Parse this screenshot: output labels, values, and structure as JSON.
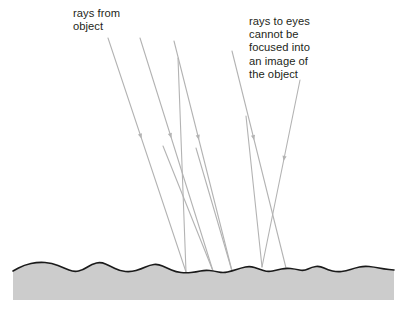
{
  "figure": {
    "type": "optics-diagram",
    "width": 406,
    "height": 313,
    "background_color": "#ffffff"
  },
  "annotations": [
    {
      "id": "rays-from-object",
      "text": "rays from\nobject",
      "lines": [
        "rays from",
        "object"
      ],
      "x": 73,
      "y": 7,
      "color": "#231f20"
    },
    {
      "id": "rays-to-eyes",
      "text": "rays to eyes\ncannot be\nfocused into\nan image of\nthe object",
      "lines": [
        "rays to eyes",
        "cannot be",
        "focused into",
        "an image of",
        "the object"
      ],
      "x": 249,
      "y": 15,
      "color": "#231f20"
    }
  ],
  "surface": {
    "name": "rough-surface",
    "fill_color": "#cccccc",
    "stroke_color": "#1a1a1a",
    "stroke_width": 1.6,
    "left_x": 13,
    "right_x": 394,
    "bottom_y": 300,
    "profile_points": [
      [
        13,
        271
      ],
      [
        24,
        265
      ],
      [
        38,
        262
      ],
      [
        52,
        263
      ],
      [
        64,
        268
      ],
      [
        74,
        272
      ],
      [
        83,
        270
      ],
      [
        92,
        264
      ],
      [
        101,
        262
      ],
      [
        110,
        266
      ],
      [
        120,
        271
      ],
      [
        131,
        272
      ],
      [
        141,
        269
      ],
      [
        150,
        265
      ],
      [
        158,
        264
      ],
      [
        167,
        268
      ],
      [
        176,
        272
      ],
      [
        186,
        273
      ],
      [
        196,
        272
      ],
      [
        205,
        270
      ],
      [
        214,
        271
      ],
      [
        223,
        273
      ],
      [
        232,
        271
      ],
      [
        241,
        268
      ],
      [
        250,
        266
      ],
      [
        259,
        269
      ],
      [
        268,
        272
      ],
      [
        277,
        270
      ],
      [
        286,
        268
      ],
      [
        295,
        269
      ],
      [
        304,
        271
      ],
      [
        312,
        267
      ],
      [
        320,
        266
      ],
      [
        328,
        270
      ],
      [
        337,
        272
      ],
      [
        346,
        271
      ],
      [
        355,
        268
      ],
      [
        364,
        266
      ],
      [
        374,
        267
      ],
      [
        384,
        269
      ],
      [
        394,
        270
      ]
    ]
  },
  "rays": {
    "incoming": {
      "label": "rays from object",
      "color": "#b3b3b3",
      "stroke_width": 1.1,
      "arrow_color": "#b3b3b3",
      "paths": [
        {
          "id": "incoming-1",
          "x1": 108,
          "y1": 38,
          "x2": 186,
          "y2": 272,
          "arrow_t": 0.42
        },
        {
          "id": "incoming-2",
          "x1": 140,
          "y1": 38,
          "x2": 213,
          "y2": 271,
          "arrow_t": 0.42
        },
        {
          "id": "incoming-3",
          "x1": 174,
          "y1": 41,
          "x2": 232,
          "y2": 271,
          "arrow_t": 0.42
        },
        {
          "id": "incoming-4",
          "x1": 232,
          "y1": 51,
          "x2": 286,
          "y2": 268,
          "arrow_t": 0.4
        },
        {
          "id": "incoming-5",
          "x1": 300,
          "y1": 80,
          "x2": 262,
          "y2": 267,
          "arrow_t": 0.42
        }
      ]
    },
    "scattered": {
      "label": "rays to eyes",
      "color": "#b3b3b3",
      "stroke_width": 1.1,
      "paths": [
        {
          "id": "scattered-1",
          "x1": 186,
          "y1": 272,
          "x2": 178,
          "y2": 58
        },
        {
          "id": "scattered-2",
          "x1": 213,
          "y1": 271,
          "x2": 163,
          "y2": 146
        },
        {
          "id": "scattered-3",
          "x1": 232,
          "y1": 271,
          "x2": 196,
          "y2": 148
        },
        {
          "id": "scattered-4",
          "x1": 262,
          "y1": 267,
          "x2": 246,
          "y2": 116
        }
      ]
    }
  }
}
